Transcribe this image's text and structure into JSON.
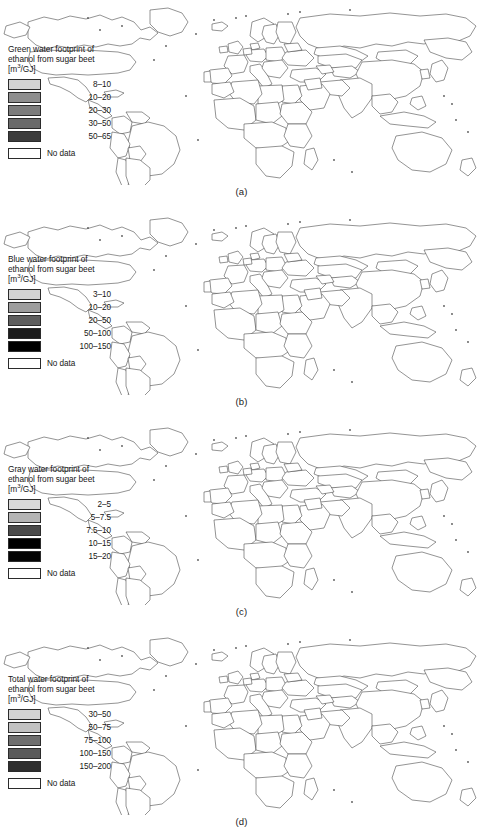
{
  "figure": {
    "title": "Water footprint of ethanol from sugar beet",
    "background_color": "#ffffff"
  },
  "chart_data": {
    "type": "heatmap",
    "subtype": "choropleth-map-series",
    "title": "Water footprint of ethanol from sugar beet",
    "units": "m3/GJ",
    "projection": "world",
    "panel_count": 4,
    "panels": [
      {
        "caption": "(a)",
        "legend_title_line1": "Green water footprint of",
        "legend_title_line2": "ethanol from sugar beet",
        "units_label": "[m3/GJ]",
        "categories": [
          "8–10",
          "10–20",
          "20–30",
          "30–50",
          "50–65",
          "No data"
        ],
        "colors": [
          "#d3d3d3",
          "#8e8e8e",
          "#7c7c7c",
          "#6a6a6a",
          "#3c3c3c",
          "#ffffff"
        ],
        "nodata_label": "No data",
        "country_values": {
          "United States": "10–20",
          "Canada": "No data",
          "Russia": "10–20",
          "China": "50–65",
          "Ukraine": "30–50",
          "Turkey": "30–50",
          "Poland": "20–30",
          "Germany": "20–30",
          "France": "20–30",
          "Spain": "20–30",
          "Morocco": "8–10",
          "Egypt": "10–20",
          "Iran": "10–20",
          "Japan": "10–20",
          "United Kingdom": "20–30",
          "Sweden": "10–20",
          "Finland": "10–20"
        }
      },
      {
        "caption": "(b)",
        "legend_title_line1": "Blue water footprint of",
        "legend_title_line2": "ethanol from sugar beet",
        "units_label": "[m3/GJ]",
        "categories": [
          "3–10",
          "10–20",
          "20–50",
          "50–100",
          "100–150",
          "No data"
        ],
        "colors": [
          "#d3d3d3",
          "#9d9d9d",
          "#5e5e5e",
          "#1c1c1c",
          "#000000",
          "#ffffff"
        ],
        "nodata_label": "No data",
        "country_values": {
          "United States": "20–50",
          "Russia": "100–150",
          "China": "20–50",
          "Ukraine": "50–100",
          "Turkey": "50–100",
          "Poland": "20–50",
          "Germany": "10–20",
          "France": "10–20",
          "Spain": "50–100",
          "Morocco": "50–100",
          "Egypt": "20–50",
          "Iran": "10–20",
          "Japan": "20–50",
          "Sweden": "10–20",
          "Finland": "50–100"
        }
      },
      {
        "caption": "(c)",
        "legend_title_line1": "Gray water footprint of",
        "legend_title_line2": "ethanol from sugar beet",
        "units_label": "[m3/GJ]",
        "categories": [
          "2–5",
          "5–7.5",
          "7.5–10",
          "10–15",
          "15–20",
          "No data"
        ],
        "colors": [
          "#d9d9d9",
          "#b4b4b4",
          "#4a4a4a",
          "#000000",
          "#050505",
          "#ffffff"
        ],
        "nodata_label": "No data",
        "country_values": {
          "United States": "2–5",
          "Russia": "10–15",
          "China": "10–15",
          "Ukraine": "10–15",
          "Turkey": "10–15",
          "Poland": "10–15",
          "Germany": "5–7.5",
          "France": "5–7.5",
          "Spain": "7.5–10",
          "Morocco": "10–15",
          "Egypt": "2–5",
          "Iran": "5–7.5",
          "Japan": "10–15",
          "Sweden": "2–5",
          "Finland": "10–15"
        }
      },
      {
        "caption": "(d)",
        "legend_title_line1": "Total water footprint of",
        "legend_title_line2": "ethanol from sugar beet",
        "units_label": "[m3/GJ]",
        "categories": [
          "30–50",
          "50–75",
          "75–100",
          "100–150",
          "150–200",
          "No data"
        ],
        "colors": [
          "#d3d3d3",
          "#c2c2c2",
          "#6e6e6e",
          "#5a5a5a",
          "#2e2e2e",
          "#ffffff"
        ],
        "nodata_label": "No data",
        "country_values": {
          "United States": "30–50",
          "Russia": "150–200",
          "China": "100–150",
          "Ukraine": "150–200",
          "Turkey": "75–100",
          "Poland": "100–150",
          "Germany": "50–75",
          "France": "50–75",
          "Spain": "75–100",
          "Morocco": "75–100",
          "Egypt": "50–75",
          "Iran": "50–75",
          "Japan": "100–150",
          "Sweden": "30–50",
          "Finland": "100–150"
        }
      }
    ]
  }
}
